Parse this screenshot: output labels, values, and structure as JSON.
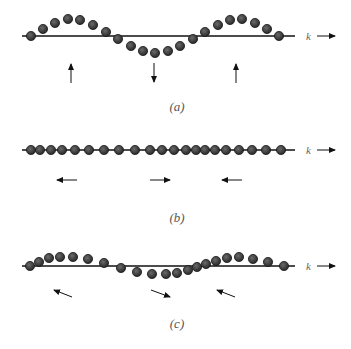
{
  "figure": {
    "wave_vector_label": "k",
    "colors": {
      "line": "#111111",
      "particle_fill": "#3a3a3a",
      "particle_stroke": "#1a1a1a",
      "arrow": "#111111",
      "text": "#555555"
    },
    "panels": [
      {
        "label": "(a)",
        "mode": "transverse",
        "axis_y": 36,
        "axis_x": [
          22,
          295
        ],
        "label_pos": [
          177,
          111
        ],
        "particles": [
          [
            31,
            36
          ],
          [
            43,
            29
          ],
          [
            55,
            23
          ],
          [
            68,
            19
          ],
          [
            80,
            20
          ],
          [
            93,
            25
          ],
          [
            106,
            32
          ],
          [
            118,
            39
          ],
          [
            131,
            46
          ],
          [
            143,
            51
          ],
          [
            155,
            53
          ],
          [
            168,
            51
          ],
          [
            180,
            46
          ],
          [
            193,
            39
          ],
          [
            205,
            32
          ],
          [
            218,
            25
          ],
          [
            230,
            20
          ],
          [
            242,
            19
          ],
          [
            255,
            23
          ],
          [
            267,
            29
          ],
          [
            279,
            36
          ]
        ],
        "arrows": [
          {
            "from": [
              71,
              83
            ],
            "to": [
              71,
              64
            ]
          },
          {
            "from": [
              154,
              63
            ],
            "to": [
              154,
              82
            ]
          },
          {
            "from": [
              236,
              83
            ],
            "to": [
              236,
              64
            ]
          }
        ]
      },
      {
        "label": "(b)",
        "mode": "longitudinal",
        "axis_y": 150,
        "axis_x": [
          22,
          295
        ],
        "label_pos": [
          177,
          222
        ],
        "particles": [
          [
            31,
            150
          ],
          [
            40,
            150
          ],
          [
            51,
            150
          ],
          [
            62,
            150
          ],
          [
            75,
            150
          ],
          [
            89,
            150
          ],
          [
            104,
            150
          ],
          [
            119,
            150
          ],
          [
            135,
            150
          ],
          [
            150,
            150
          ],
          [
            162,
            150
          ],
          [
            174,
            150
          ],
          [
            186,
            150
          ],
          [
            196,
            150
          ],
          [
            205,
            150
          ],
          [
            215,
            150
          ],
          [
            226,
            150
          ],
          [
            239,
            150
          ],
          [
            252,
            150
          ],
          [
            266,
            150
          ],
          [
            281,
            150
          ]
        ],
        "arrows": [
          {
            "from": [
              77,
              180
            ],
            "to": [
              57,
              180
            ]
          },
          {
            "from": [
              150,
              180
            ],
            "to": [
              170,
              180
            ]
          },
          {
            "from": [
              242,
              180
            ],
            "to": [
              222,
              180
            ]
          }
        ]
      },
      {
        "label": "(c)",
        "mode": "mixed",
        "axis_y": 266,
        "axis_x": [
          22,
          295
        ],
        "label_pos": [
          177,
          328
        ],
        "particles": [
          [
            30,
            266
          ],
          [
            39,
            262
          ],
          [
            49,
            258
          ],
          [
            60,
            257
          ],
          [
            73,
            257
          ],
          [
            88,
            259
          ],
          [
            104,
            263
          ],
          [
            121,
            268
          ],
          [
            137,
            272
          ],
          [
            152,
            274
          ],
          [
            166,
            274
          ],
          [
            177,
            273
          ],
          [
            188,
            270
          ],
          [
            197,
            267
          ],
          [
            206,
            264
          ],
          [
            216,
            261
          ],
          [
            227,
            258
          ],
          [
            239,
            257
          ],
          [
            253,
            259
          ],
          [
            268,
            262
          ],
          [
            284,
            266
          ]
        ],
        "arrows": [
          {
            "from": [
              72,
              297
            ],
            "to": [
              54,
              290
            ]
          },
          {
            "from": [
              151,
              290
            ],
            "to": [
              170,
              297
            ]
          },
          {
            "from": [
              235,
              297
            ],
            "to": [
              217,
              290
            ]
          }
        ]
      }
    ],
    "k_arrows": [
      {
        "text_pos": [
          306,
          40
        ],
        "from": [
          317,
          36
        ],
        "to": [
          335,
          36
        ]
      },
      {
        "text_pos": [
          306,
          154
        ],
        "from": [
          317,
          150
        ],
        "to": [
          335,
          150
        ]
      },
      {
        "text_pos": [
          306,
          270
        ],
        "from": [
          317,
          266
        ],
        "to": [
          335,
          266
        ]
      }
    ]
  }
}
